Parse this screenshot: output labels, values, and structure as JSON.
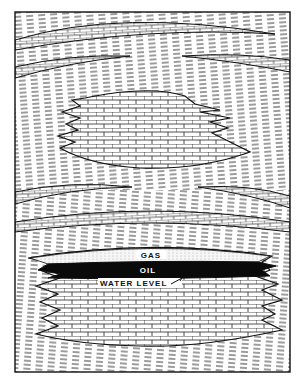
{
  "diagram": {
    "type": "geological cross-section",
    "labels": {
      "gas": "GAS",
      "oil": "OIL",
      "water_level": "WATER LEVEL"
    },
    "layers": [
      {
        "name": "upper-limestone-band",
        "kind": "brick"
      },
      {
        "name": "second-limestone-band-left",
        "kind": "brick"
      },
      {
        "name": "second-limestone-band-right",
        "kind": "brick"
      },
      {
        "name": "upper-lens",
        "kind": "brick"
      },
      {
        "name": "middle-band-left",
        "kind": "brick"
      },
      {
        "name": "middle-band-right",
        "kind": "brick"
      },
      {
        "name": "lower-continuous-band",
        "kind": "brick"
      },
      {
        "name": "reservoir-lens",
        "kind": "brick",
        "fluids": [
          "gas",
          "oil",
          "water"
        ]
      }
    ],
    "colors": {
      "ink": "#111111",
      "paper": "#ffffff",
      "oil": "#0a0a0a",
      "gas": "#f4f4f4"
    }
  }
}
